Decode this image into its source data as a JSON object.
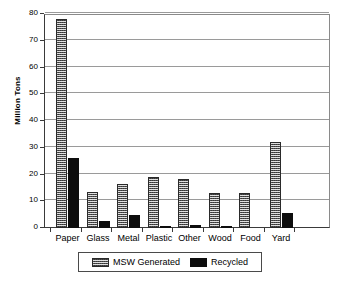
{
  "chart_data": {
    "type": "bar",
    "title": "",
    "xlabel": "",
    "ylabel": "Million Tons",
    "ylim": [
      0,
      80
    ],
    "yticks": [
      0,
      10,
      20,
      30,
      40,
      50,
      60,
      70,
      80
    ],
    "ytick_labels": [
      "0",
      "10",
      "20",
      "30",
      "40",
      "50",
      "60",
      "70",
      "80"
    ],
    "grid": true,
    "legend_position": "bottom",
    "categories": [
      "Paper",
      "Glass",
      "Metal",
      "Plastic",
      "Other",
      "Wood",
      "Food",
      "Yard"
    ],
    "series": [
      {
        "name": "MSW Generated",
        "fill": "hatched",
        "color": "#1d1d1d",
        "values": [
          78,
          13.5,
          16.5,
          19,
          18.2,
          13,
          13,
          32
        ]
      },
      {
        "name": "Recycled",
        "fill": "solid",
        "color": "#0d0d0d",
        "values": [
          26,
          2.7,
          4.8,
          0.5,
          1.3,
          0.8,
          0,
          5.8
        ]
      }
    ]
  },
  "legend": {
    "items": [
      {
        "label": "MSW Generated",
        "swatch": "hatched-swatch-icon"
      },
      {
        "label": "Recycled",
        "swatch": "solid-swatch-icon"
      }
    ]
  }
}
